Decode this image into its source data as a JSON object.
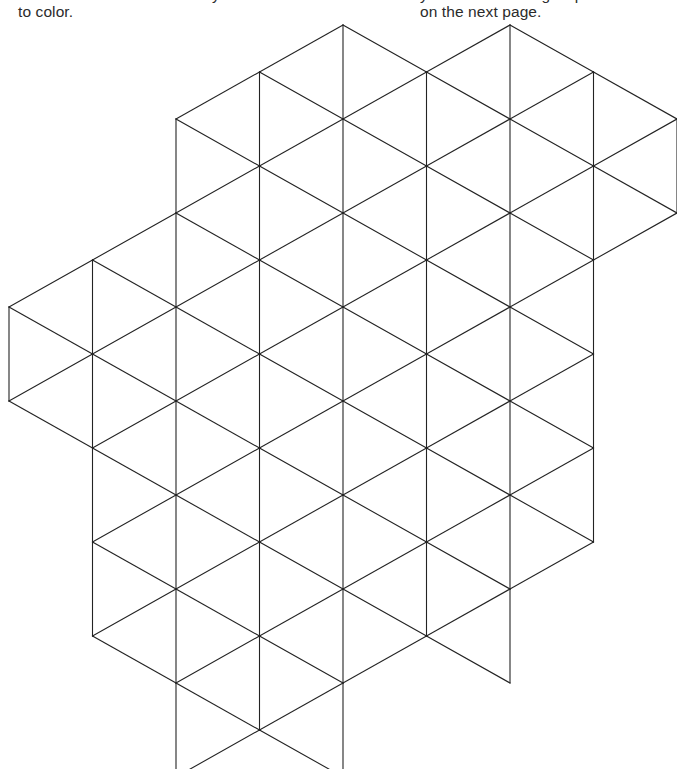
{
  "page": {
    "width": 677,
    "height": 769,
    "background": "#ffffff",
    "kind": "coloring-book-page"
  },
  "captions": {
    "left": "to color.",
    "right": "on the next page.",
    "right_cropped": "your colored triangles p",
    "mid_cropped": "y"
  },
  "artwork": {
    "name": "isometric-triangle-lattice",
    "description": "Hexagon-shaped arrangement of equilateral triangles drawn as thin black outlines on white, to be colored in.",
    "stroke_color": "#232323",
    "stroke_width": 1.1,
    "fill": "none",
    "geometry": {
      "half_column_step": 83.5,
      "row_step": 94,
      "origin_x": 9,
      "origin_y": 25,
      "columns": 9,
      "rows": 9
    },
    "cells": [
      {
        "col_start": 2,
        "col_end": 6,
        "row_top": 0,
        "row_bottom": 3,
        "label": "top-band"
      },
      {
        "col_start": 0,
        "col_end": 8,
        "row_top": 1,
        "row_bottom": 4,
        "label": "upper-wide-band"
      },
      {
        "col_start": 0,
        "col_end": 7,
        "row_top": 3,
        "row_bottom": 6,
        "label": "middle-band"
      },
      {
        "col_start": 1,
        "col_end": 7,
        "row_top": 5,
        "row_bottom": 7,
        "label": "lower-band"
      },
      {
        "col_start": 2,
        "col_end": 6,
        "row_top": 6,
        "row_bottom": 8,
        "label": "bottom-band"
      }
    ]
  }
}
